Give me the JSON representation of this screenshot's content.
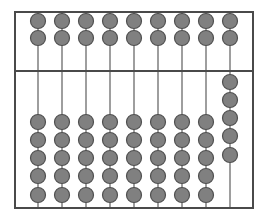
{
  "abacus": {
    "frame": {
      "left": 15,
      "top": 12,
      "right": 253,
      "bottom": 208,
      "divider_y": 71
    },
    "colors": {
      "frame": "#4a4a4a",
      "rod": "#6a6a6a",
      "bead_fill": "#808080",
      "bead_stroke": "#505050",
      "background": "#ffffff"
    },
    "bead_radius": 7.5,
    "columns": [
      {
        "x": 38,
        "upper_beads_y": [
          21,
          38
        ],
        "lower_beads_y": [
          122,
          140,
          158,
          176,
          195
        ]
      },
      {
        "x": 62,
        "upper_beads_y": [
          21,
          38
        ],
        "lower_beads_y": [
          122,
          140,
          158,
          176,
          195
        ]
      },
      {
        "x": 86,
        "upper_beads_y": [
          21,
          38
        ],
        "lower_beads_y": [
          122,
          140,
          158,
          176,
          195
        ]
      },
      {
        "x": 110,
        "upper_beads_y": [
          21,
          38
        ],
        "lower_beads_y": [
          122,
          140,
          158,
          176,
          195
        ]
      },
      {
        "x": 134,
        "upper_beads_y": [
          21,
          38
        ],
        "lower_beads_y": [
          122,
          140,
          158,
          176,
          195
        ]
      },
      {
        "x": 158,
        "upper_beads_y": [
          21,
          38
        ],
        "lower_beads_y": [
          122,
          140,
          158,
          176,
          195
        ]
      },
      {
        "x": 182,
        "upper_beads_y": [
          21,
          38
        ],
        "lower_beads_y": [
          122,
          140,
          158,
          176,
          195
        ]
      },
      {
        "x": 206,
        "upper_beads_y": [
          21,
          38
        ],
        "lower_beads_y": [
          122,
          140,
          158,
          176,
          195
        ]
      },
      {
        "x": 230,
        "upper_beads_y": [
          21,
          38
        ],
        "lower_beads_y": [
          82,
          100,
          118,
          136,
          155
        ]
      }
    ]
  }
}
